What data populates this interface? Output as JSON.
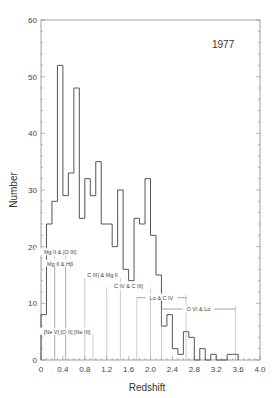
{
  "chart_data": {
    "type": "bar",
    "subtype": "histogram",
    "title": "",
    "annotation_year": "1977",
    "xlabel": "Redshift",
    "ylabel": "Number",
    "xlim": [
      0,
      4.0
    ],
    "ylim": [
      0,
      60
    ],
    "xticks": [
      "0",
      "0.4",
      "0.8",
      "1.2",
      "1.6",
      "2.0",
      "2.4",
      "2.8",
      "3.2",
      "3.6",
      "4.0"
    ],
    "xtick_values": [
      0,
      0.4,
      0.8,
      1.2,
      1.6,
      2.0,
      2.4,
      2.8,
      3.2,
      3.6,
      4.0
    ],
    "yticks": [
      "0",
      "10",
      "20",
      "30",
      "40",
      "50",
      "60"
    ],
    "ytick_values": [
      0,
      10,
      20,
      30,
      40,
      50,
      60
    ],
    "grid": false,
    "bin_width": 0.1,
    "bin_starts": [
      0.0,
      0.1,
      0.2,
      0.3,
      0.4,
      0.5,
      0.6,
      0.7,
      0.8,
      0.9,
      1.0,
      1.1,
      1.2,
      1.3,
      1.4,
      1.5,
      1.6,
      1.7,
      1.8,
      1.9,
      2.0,
      2.1,
      2.2,
      2.3,
      2.4,
      2.5,
      2.6,
      2.7,
      2.8,
      2.9,
      3.0,
      3.1,
      3.2,
      3.3,
      3.4,
      3.5
    ],
    "values": [
      8,
      24,
      28,
      52,
      29,
      33,
      48,
      25,
      32,
      29,
      35,
      24,
      24,
      20,
      30,
      16,
      14,
      25,
      24,
      32,
      22,
      15,
      6,
      8,
      2,
      1,
      5,
      4,
      0,
      2,
      0,
      1,
      0,
      0,
      1,
      1
    ],
    "line_annotations": [
      {
        "label": "Mg II & [O III]",
        "z_start": 0.25,
        "z_end": 0.45,
        "y": 19
      },
      {
        "label": "Mg II & Hβ",
        "z_start": 0.25,
        "z_end": 0.45,
        "y": 17
      },
      {
        "label": "C III] & Mg II",
        "z_start": 0.8,
        "z_end": 1.45,
        "y": 15
      },
      {
        "label": "C IV & C III]",
        "z_start": 1.2,
        "z_end": 2.0,
        "y": 13
      },
      {
        "label": "Lα & C IV",
        "z_start": 1.75,
        "z_end": 2.65,
        "y": 11
      },
      {
        "label": "O VI & Lα",
        "z_start": 2.2,
        "z_end": 3.55,
        "y": 9
      },
      {
        "label": "[Ne V] [O II] [Ne III]",
        "z_start": 0.0,
        "z_end": 0.95,
        "y": 5
      }
    ]
  }
}
